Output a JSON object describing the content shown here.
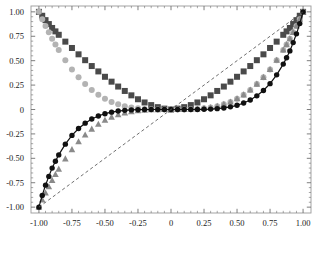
{
  "figure": {
    "background": "#ffffff",
    "frame_color": "#9a9a9a",
    "tick_color": "#6f6f6f",
    "label_color": "#1a1a1a",
    "caption": ""
  },
  "chart_data": {
    "type": "scatter",
    "title": "",
    "subtitle": "",
    "xlabel": "",
    "ylabel": "",
    "xlim": [
      -1.06,
      1.06
    ],
    "ylim": [
      -1.06,
      1.06
    ],
    "grid": false,
    "legend": "none",
    "frame": true,
    "xticks": [
      -1.0,
      -0.75,
      -0.5,
      -0.25,
      0,
      0.25,
      0.5,
      0.75,
      1.0
    ],
    "xticklabels": [
      "-1.00",
      "-0.75",
      "-0.50",
      "-0.25",
      "0",
      "0.25",
      "0.50",
      "0.75",
      "1.00"
    ],
    "yticks": [
      -1.0,
      -0.75,
      -0.5,
      -0.25,
      0,
      0.25,
      0.5,
      0.75,
      1.0
    ],
    "yticklabels": [
      "-1.00",
      "-0.75",
      "-0.50",
      "-0.25",
      "0",
      "0.25",
      "0.50",
      "0.75",
      "1.00"
    ],
    "minor_ticks": true,
    "x": [
      -1.0,
      -0.975,
      -0.95,
      -0.925,
      -0.9,
      -0.875,
      -0.85,
      -0.8,
      -0.75,
      -0.7,
      -0.65,
      -0.6,
      -0.55,
      -0.5,
      -0.45,
      -0.4,
      -0.35,
      -0.3,
      -0.25,
      -0.2,
      -0.15,
      -0.1,
      -0.05,
      0.0,
      0.05,
      0.1,
      0.15,
      0.2,
      0.25,
      0.3,
      0.35,
      0.4,
      0.45,
      0.5,
      0.55,
      0.6,
      0.65,
      0.7,
      0.75,
      0.8,
      0.85,
      0.875,
      0.9,
      0.925,
      0.95,
      0.975,
      1.0
    ],
    "series": [
      {
        "name": "series-dark-square",
        "marker": "square",
        "color": "#4a4a4a",
        "line": "none",
        "values": [
          1.0,
          0.96,
          0.915,
          0.875,
          0.835,
          0.8,
          0.765,
          0.695,
          0.63,
          0.565,
          0.505,
          0.445,
          0.39,
          0.335,
          0.285,
          0.235,
          0.19,
          0.145,
          0.105,
          0.072,
          0.045,
          0.024,
          0.009,
          0.0,
          0.009,
          0.024,
          0.045,
          0.072,
          0.105,
          0.145,
          0.19,
          0.235,
          0.285,
          0.335,
          0.39,
          0.445,
          0.505,
          0.565,
          0.63,
          0.695,
          0.765,
          0.8,
          0.835,
          0.875,
          0.915,
          0.96,
          1.0
        ]
      },
      {
        "name": "series-light-circle",
        "marker": "circle",
        "color": "#b3b3b3",
        "line": "none",
        "values": [
          1.0,
          0.925,
          0.855,
          0.79,
          0.725,
          0.665,
          0.61,
          0.505,
          0.41,
          0.33,
          0.26,
          0.2,
          0.15,
          0.11,
          0.078,
          0.053,
          0.034,
          0.021,
          0.012,
          0.006,
          0.0026,
          0.0008,
          0.0001,
          0.0,
          0.0001,
          0.0008,
          0.0026,
          0.006,
          0.012,
          0.021,
          0.034,
          0.053,
          0.078,
          0.11,
          0.15,
          0.2,
          0.26,
          0.33,
          0.41,
          0.505,
          0.61,
          0.665,
          0.725,
          0.79,
          0.855,
          0.925,
          1.0
        ]
      },
      {
        "name": "series-gray-triangle",
        "marker": "triangle",
        "color": "#8a8a8a",
        "line": "none",
        "values": [
          -1.0,
          -0.925,
          -0.855,
          -0.79,
          -0.725,
          -0.665,
          -0.61,
          -0.505,
          -0.41,
          -0.33,
          -0.26,
          -0.2,
          -0.15,
          -0.11,
          -0.078,
          -0.053,
          -0.034,
          -0.021,
          -0.012,
          -0.006,
          -0.0026,
          -0.0008,
          -0.0001,
          0.0,
          0.0001,
          0.0008,
          0.0026,
          0.006,
          0.012,
          0.021,
          0.034,
          0.053,
          0.078,
          0.11,
          0.15,
          0.2,
          0.26,
          0.33,
          0.41,
          0.505,
          0.61,
          0.665,
          0.725,
          0.79,
          0.855,
          0.925,
          1.0
        ]
      },
      {
        "name": "series-black-circle-line",
        "marker": "circle",
        "color": "#111111",
        "line": "solid",
        "values": [
          -1.0,
          -0.88,
          -0.775,
          -0.685,
          -0.6,
          -0.53,
          -0.465,
          -0.355,
          -0.265,
          -0.195,
          -0.14,
          -0.098,
          -0.066,
          -0.043,
          -0.027,
          -0.016,
          -0.0086,
          -0.0042,
          -0.0019,
          -0.00075,
          -0.00025,
          -5e-05,
          -3e-06,
          0.0,
          3e-06,
          5e-05,
          0.00025,
          0.00075,
          0.0019,
          0.0042,
          0.0086,
          0.016,
          0.027,
          0.043,
          0.066,
          0.098,
          0.14,
          0.195,
          0.265,
          0.355,
          0.465,
          0.53,
          0.6,
          0.685,
          0.775,
          0.88,
          1.0
        ]
      },
      {
        "name": "reference-line-identity",
        "marker": "none",
        "color": "#555555",
        "line": "dashed",
        "values": [
          -1.0,
          -0.975,
          -0.95,
          -0.925,
          -0.9,
          -0.875,
          -0.85,
          -0.8,
          -0.75,
          -0.7,
          -0.65,
          -0.6,
          -0.55,
          -0.5,
          -0.45,
          -0.4,
          -0.35,
          -0.3,
          -0.25,
          -0.2,
          -0.15,
          -0.1,
          -0.05,
          0.0,
          0.05,
          0.1,
          0.15,
          0.2,
          0.25,
          0.3,
          0.35,
          0.4,
          0.45,
          0.5,
          0.55,
          0.6,
          0.65,
          0.7,
          0.75,
          0.8,
          0.85,
          0.875,
          0.9,
          0.925,
          0.95,
          0.975,
          1.0
        ]
      }
    ]
  }
}
